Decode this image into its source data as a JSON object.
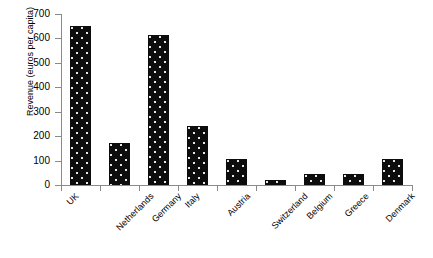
{
  "chart_data": {
    "type": "bar",
    "title": "",
    "xlabel": "",
    "ylabel": "Revenue (euros per capita)",
    "categories": [
      "UK",
      "Netherlands",
      "Germany",
      "Italy",
      "Austria",
      "Switzerland",
      "Belgium",
      "Greece",
      "Denmark"
    ],
    "values": [
      650,
      170,
      615,
      243,
      108,
      22,
      47,
      47,
      108
    ],
    "ylim": [
      0,
      700
    ],
    "yticks": [
      0,
      100,
      200,
      300,
      400,
      500,
      600,
      700
    ],
    "ytick_labels": [
      "0",
      "100",
      "200",
      "300",
      "400",
      "500",
      "600",
      "700"
    ],
    "grid": false,
    "legend": false,
    "series": [
      {
        "name": "Revenue",
        "values": [
          650,
          170,
          615,
          243,
          108,
          22,
          47,
          47,
          108
        ],
        "color": "#0d0d0d",
        "fill_pattern": "dotted"
      }
    ],
    "axis_color": "#8a8a8a",
    "category_label_rotation": -45
  }
}
